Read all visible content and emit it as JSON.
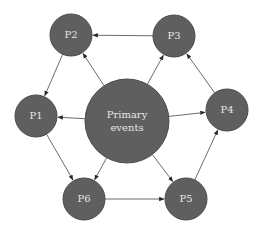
{
  "diagram": {
    "type": "cycle-network",
    "colors": {
      "node_fill": "#5f5f5f",
      "label": "#e6e6e6",
      "edge": "#5a5a5a",
      "background": "#ffffff"
    },
    "nodes": [
      {
        "id": "primary",
        "label_line1": "Primary",
        "label_line2": "events",
        "cx": 127,
        "cy": 121,
        "r": 42
      },
      {
        "id": "P1",
        "label": "P1",
        "cx": 36,
        "cy": 116,
        "r": 21
      },
      {
        "id": "P2",
        "label": "P2",
        "cx": 71,
        "cy": 35,
        "r": 21
      },
      {
        "id": "P3",
        "label": "P3",
        "cx": 174,
        "cy": 36,
        "r": 21
      },
      {
        "id": "P4",
        "label": "P4",
        "cx": 227,
        "cy": 110,
        "r": 21
      },
      {
        "id": "P5",
        "label": "P5",
        "cx": 186,
        "cy": 199,
        "r": 21
      },
      {
        "id": "P6",
        "label": "P6",
        "cx": 84,
        "cy": 199,
        "r": 21
      }
    ],
    "edges": [
      {
        "from": "P3",
        "to": "P2"
      },
      {
        "from": "primary",
        "to": "P2"
      },
      {
        "from": "primary",
        "to": "P3"
      },
      {
        "from": "P4",
        "to": "P3"
      },
      {
        "from": "P2",
        "to": "P1"
      },
      {
        "from": "primary",
        "to": "P1"
      },
      {
        "from": "primary",
        "to": "P4"
      },
      {
        "from": "P1",
        "to": "P6"
      },
      {
        "from": "primary",
        "to": "P6"
      },
      {
        "from": "primary",
        "to": "P5"
      },
      {
        "from": "P6",
        "to": "P5"
      },
      {
        "from": "P5",
        "to": "P4"
      }
    ]
  }
}
